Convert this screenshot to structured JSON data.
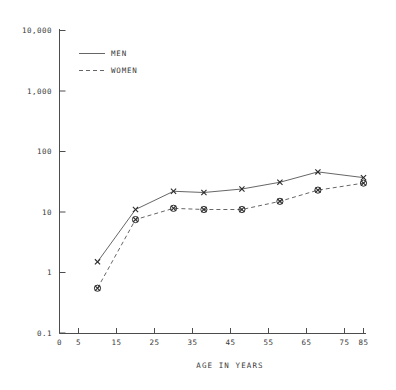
{
  "chart_data": {
    "type": "line",
    "title": "",
    "xlabel": "AGE IN YEARS",
    "ylabel": "",
    "yscale": "log",
    "ylim": [
      0.1,
      10000
    ],
    "xlim": [
      0,
      85
    ],
    "grid": false,
    "legend_position": "top-left-inside",
    "x_ticks": [
      0,
      5,
      15,
      25,
      35,
      45,
      55,
      65,
      75,
      85
    ],
    "x_tick_labels": [
      "0",
      "5",
      "15",
      "25",
      "35",
      "45",
      "55",
      "65",
      "75",
      "85"
    ],
    "y_ticks": [
      0.1,
      1,
      10,
      100,
      1000,
      10000
    ],
    "y_tick_labels": [
      "0.1",
      "1",
      "10",
      "100",
      "1,000",
      "10,000"
    ],
    "x": [
      10,
      20,
      30,
      38,
      48,
      58,
      68,
      80
    ],
    "series": [
      {
        "name": "MEN",
        "style": "solid",
        "marker": "x",
        "values": [
          1.5,
          11.0,
          22.0,
          21.0,
          24.0,
          31.0,
          46.0,
          37.0
        ]
      },
      {
        "name": "WOMEN",
        "style": "dashed",
        "marker": "circle-x",
        "values": [
          0.55,
          7.5,
          11.5,
          11.0,
          11.0,
          15.0,
          23.0,
          30.0
        ]
      }
    ],
    "legend": [
      {
        "label": "MEN",
        "style": "solid"
      },
      {
        "label": "WOMEN",
        "style": "dashed"
      }
    ],
    "colors": {
      "line": "#555555",
      "marker": "#2b2b2b",
      "axis": "#4d4d4d",
      "text": "#3a3a3a",
      "background": "#ffffff"
    }
  },
  "axis": {
    "x_title": "AGE IN YEARS"
  },
  "legend": {
    "men_label": "MEN",
    "women_label": "WOMEN"
  },
  "y_labels": {
    "t0": "10,000",
    "t1": "1,000",
    "t2": "100",
    "t3": "10",
    "t4": "1",
    "t5": "0.1"
  },
  "x_labels": {
    "t0": "0",
    "t1": "5",
    "t2": "15",
    "t3": "25",
    "t4": "35",
    "t5": "45",
    "t6": "55",
    "t7": "65",
    "t8": "75",
    "t9": "85"
  }
}
